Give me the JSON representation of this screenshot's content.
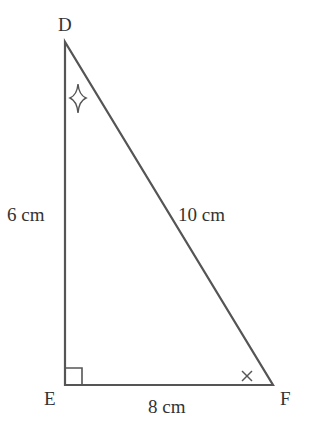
{
  "diagram": {
    "type": "right-triangle",
    "vertices": [
      {
        "name": "D",
        "x": 65,
        "y": 42
      },
      {
        "name": "E",
        "x": 65,
        "y": 385
      },
      {
        "name": "F",
        "x": 273,
        "y": 385
      }
    ],
    "sides": {
      "DE": "6 cm",
      "EF": "8 cm",
      "DF": "10 cm"
    },
    "angle_marks": {
      "E": "right-angle",
      "D": "four-point-star",
      "F": "cross"
    },
    "line_color": "#555555",
    "text_color": "#333333"
  }
}
